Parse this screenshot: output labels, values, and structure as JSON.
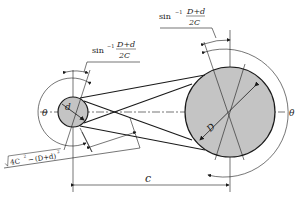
{
  "diagram": {
    "colors": {
      "pulley_fill": "#c4c4c4",
      "stroke": "#1a1a1a",
      "background": "#ffffff"
    },
    "labels": {
      "small_diameter": "d",
      "large_diameter": "D",
      "center_distance": "c",
      "wrap_angle_left": "θ",
      "wrap_angle_right": "θ",
      "angle_top_right": {
        "fn": "sin",
        "exp": "−1",
        "numerator": "D+d",
        "denominator": "2C"
      },
      "angle_top_left": {
        "fn": "sin",
        "exp": "−1",
        "numerator": "D+d",
        "denominator": "2C"
      },
      "belt_span_length": {
        "radicand_a": "4C",
        "radicand_a_exp": "2",
        "minus": "−",
        "radicand_b": "(D+d)",
        "radicand_b_exp": "2"
      }
    }
  }
}
